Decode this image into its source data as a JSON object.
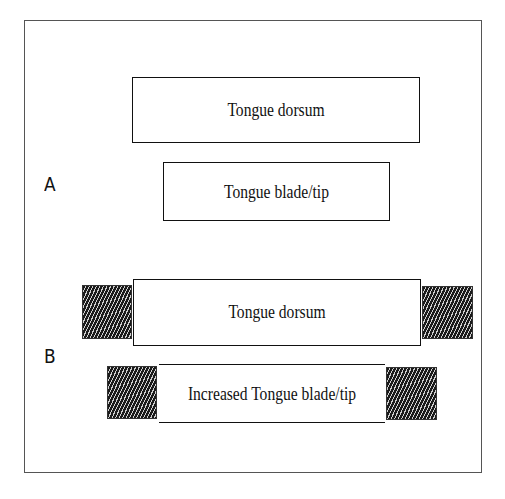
{
  "panels": [
    {
      "label": "A",
      "boxes": [
        {
          "text": "Tongue dorsum",
          "hatched_sides": false
        },
        {
          "text": "Tongue blade/tip",
          "hatched_sides": false
        }
      ]
    },
    {
      "label": "B",
      "boxes": [
        {
          "text": "Tongue dorsum",
          "hatched_sides": true
        },
        {
          "text": "Increased Tongue blade/tip",
          "hatched_sides": true
        }
      ]
    }
  ]
}
